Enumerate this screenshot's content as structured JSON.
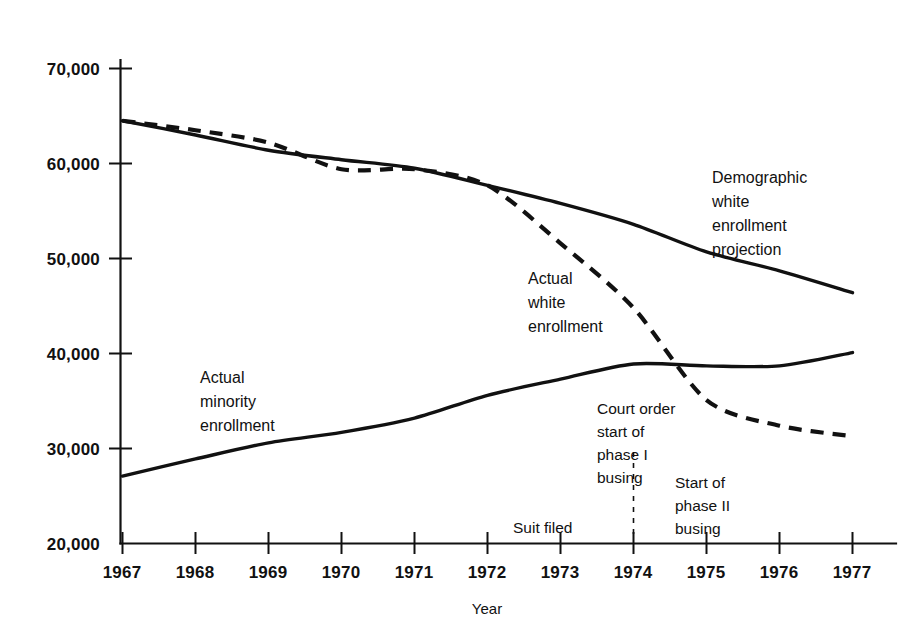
{
  "chart_data": {
    "type": "line",
    "title": "",
    "xlabel": "Year",
    "ylabel": "",
    "grid": false,
    "legend_position": "inline-annotations",
    "x": [
      1967,
      1968,
      1969,
      1970,
      1971,
      1972,
      1973,
      1974,
      1975,
      1976,
      1977
    ],
    "xtick_labels": [
      "1967",
      "1968",
      "1969",
      "1970",
      "1971",
      "1972",
      "1973",
      "1974",
      "1975",
      "1976",
      "1977"
    ],
    "xlim": [
      1967,
      1977
    ],
    "ylim": [
      20000,
      70000
    ],
    "ytick_values": [
      20000,
      30000,
      40000,
      50000,
      60000,
      70000
    ],
    "ytick_labels": [
      "20,000",
      "30,000",
      "40,000",
      "50,000",
      "60,000",
      "70,000"
    ],
    "series": [
      {
        "name": "Demographic white enrollment projection",
        "style": "solid",
        "label_lines": [
          "Demographic",
          "white",
          "enrollment",
          "projection"
        ],
        "values": [
          64500,
          63000,
          61400,
          60400,
          59500,
          57700,
          55800,
          53600,
          50700,
          48700,
          46400
        ]
      },
      {
        "name": "Actual white enrollment",
        "style": "dashed",
        "label_lines": [
          "Actual",
          "white",
          "enrollment"
        ],
        "values": [
          64500,
          63500,
          62200,
          59400,
          59400,
          57700,
          51600,
          44800,
          35100,
          32400,
          31300
        ]
      },
      {
        "name": "Actual minority enrollment",
        "style": "solid",
        "label_lines": [
          "Actual",
          "minority",
          "enrollment"
        ],
        "values": [
          27100,
          28900,
          30600,
          31700,
          33200,
          35600,
          37300,
          38900,
          38700,
          38700,
          40100
        ]
      }
    ],
    "annotations": [
      {
        "id": "suit-filed",
        "lines": [
          "Suit filed"
        ],
        "x_value": 1973,
        "leader": false
      },
      {
        "id": "court-order-phase-1",
        "lines": [
          "Court order",
          "start of",
          "phase I",
          "busing"
        ],
        "x_value": 1974,
        "leader": true
      },
      {
        "id": "start-phase-2",
        "lines": [
          "Start of",
          "phase II",
          "busing"
        ],
        "x_value": 1975,
        "leader": false
      }
    ],
    "colors": {
      "line": "#111111",
      "text": "#111111",
      "background": "#ffffff"
    }
  }
}
